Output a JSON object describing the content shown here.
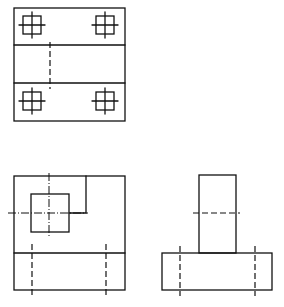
{
  "drawing": {
    "type": "orthographic-projection",
    "views": [
      {
        "name": "top-view",
        "holes": 4
      },
      {
        "name": "front-view",
        "holes": 1
      },
      {
        "name": "side-view"
      }
    ],
    "colors": {
      "line": "#111111",
      "background": "#ffffff"
    }
  }
}
